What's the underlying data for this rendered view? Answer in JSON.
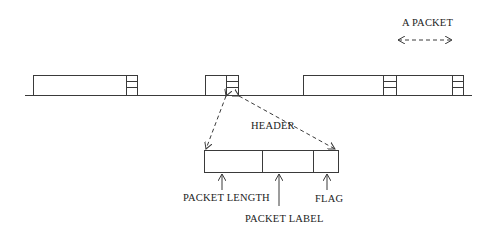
{
  "diagram": {
    "title_label": "A PACKET",
    "header_label": "HEADER",
    "fields": {
      "packet_length": "PACKET LENGTH",
      "packet_label": "PACKET LABEL",
      "flag": "FLAG"
    },
    "baseline": {
      "x1": 25,
      "x2": 472,
      "y": 95
    },
    "packets": [
      {
        "x": 33,
        "width": 105,
        "header_x": 126
      },
      {
        "x": 205,
        "width": 33,
        "header_x": 226
      },
      {
        "x": 303,
        "width": 145,
        "header_x": 383
      },
      {
        "x": 303,
        "width": 161,
        "header_x": 452
      }
    ],
    "header_fields_box": {
      "x": 204,
      "y": 150,
      "width": 135,
      "height": 22,
      "dividers": [
        262,
        313
      ]
    },
    "colors": {
      "stroke": "#3a3a3a",
      "text": "#222222",
      "background": "#ffffff"
    }
  }
}
